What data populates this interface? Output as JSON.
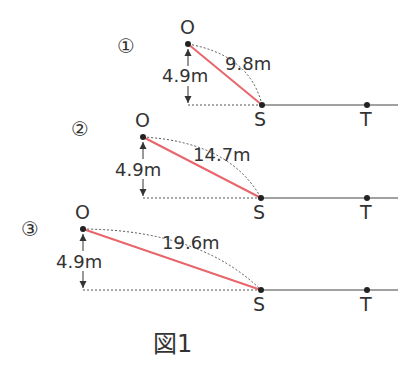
{
  "figure": {
    "caption": "図1",
    "colors": {
      "ink": "#333333",
      "trajectory": "#e8666b",
      "dashed": "#555555",
      "ground": "#444444"
    },
    "panels": [
      {
        "marker": "①",
        "origin_label": "O",
        "start_label": "S",
        "target_label": "T",
        "height_label": "4.9m",
        "distance_label": "9.8m"
      },
      {
        "marker": "②",
        "origin_label": "O",
        "start_label": "S",
        "target_label": "T",
        "height_label": "4.9m",
        "distance_label": "14.7m"
      },
      {
        "marker": "③",
        "origin_label": "O",
        "start_label": "S",
        "target_label": "T",
        "height_label": "4.9m",
        "distance_label": "19.6m"
      }
    ]
  }
}
